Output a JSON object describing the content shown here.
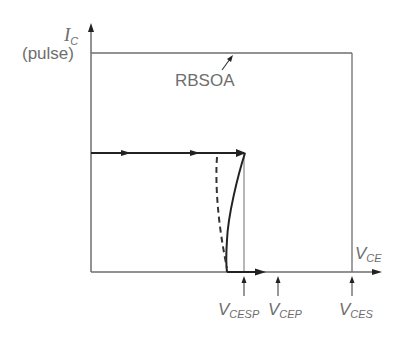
{
  "axes": {
    "y_label_main": "I",
    "y_label_sub": "C",
    "y_label_note": "(pulse)",
    "x_label_main": "V",
    "x_label_sub": "CE"
  },
  "region": {
    "label": "RBSOA"
  },
  "markers": [
    {
      "main": "V",
      "sub": "CESP"
    },
    {
      "main": "V",
      "sub": "CEP"
    },
    {
      "main": "V",
      "sub": "CES"
    }
  ],
  "colors": {
    "axis": "#6e6e6e",
    "trajectory": "#222222",
    "text": "#6e6e6e"
  }
}
